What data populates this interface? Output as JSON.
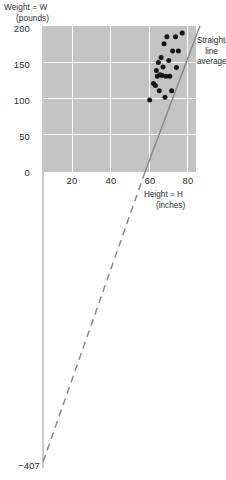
{
  "axes": {
    "y_title_line1": "Weight = W",
    "y_title_line2": "(pounds)",
    "x_title_line1": "Height = H",
    "x_title_line2": "(inches)",
    "y_ticks": [
      "200",
      "150",
      "100",
      "50",
      "0"
    ],
    "x_ticks": [
      "20",
      "40",
      "60",
      "80"
    ],
    "intercept_label": "−407"
  },
  "annotation": {
    "line1": "Straight-",
    "line2": "line",
    "line3": "average"
  },
  "colors": {
    "panel": "#c3c3c3",
    "grid": "#ffffff",
    "point": "#151515",
    "line": "#8a8a8a",
    "axis": "#c9c9c9",
    "text": "#2b2b2b"
  },
  "chart_data": {
    "type": "scatter",
    "title": "",
    "xlabel": "Height = H (inches)",
    "ylabel": "Weight = W (pounds)",
    "xlim": [
      3.8,
      84.2
    ],
    "ylim": [
      0,
      202.8
    ],
    "xticks": [
      20,
      40,
      60,
      80
    ],
    "yticks": [
      0,
      50,
      100,
      150,
      200
    ],
    "grid": true,
    "legend": false,
    "points": [
      {
        "x": 60.0,
        "y": 100.0
      },
      {
        "x": 62.0,
        "y": 123.0
      },
      {
        "x": 63.0,
        "y": 120.0
      },
      {
        "x": 63.5,
        "y": 141.0
      },
      {
        "x": 64.0,
        "y": 133.0
      },
      {
        "x": 64.5,
        "y": 152.0
      },
      {
        "x": 65.0,
        "y": 113.0
      },
      {
        "x": 65.5,
        "y": 135.0
      },
      {
        "x": 66.0,
        "y": 159.0
      },
      {
        "x": 66.5,
        "y": 134.0
      },
      {
        "x": 67.0,
        "y": 146.0
      },
      {
        "x": 67.5,
        "y": 178.0
      },
      {
        "x": 68.0,
        "y": 104.0
      },
      {
        "x": 68.5,
        "y": 133.0
      },
      {
        "x": 69.0,
        "y": 188.0
      },
      {
        "x": 70.0,
        "y": 155.0
      },
      {
        "x": 70.5,
        "y": 133.0
      },
      {
        "x": 71.5,
        "y": 113.0
      },
      {
        "x": 72.0,
        "y": 168.0
      },
      {
        "x": 73.5,
        "y": 188.0
      },
      {
        "x": 74.0,
        "y": 145.0
      },
      {
        "x": 75.0,
        "y": 168.0
      },
      {
        "x": 77.0,
        "y": 193.0
      }
    ],
    "fit_line": {
      "label": "Straight-line average",
      "style": "dashed",
      "slope": 7.07,
      "intercept": -407,
      "y_axis_crossing": -407,
      "x_at_zero": 57.6
    }
  }
}
